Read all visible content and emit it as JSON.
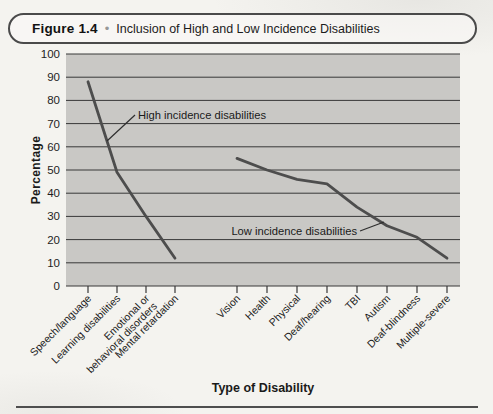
{
  "figure": {
    "label": "Figure 1.4",
    "bullet": "•",
    "title": "Inclusion of High and Low Incidence Disabilities"
  },
  "chart_data": {
    "type": "line",
    "title": "Figure 1.4 • Inclusion of High and Low Incidence Disabilities",
    "xlabel": "Type of Disability",
    "ylabel": "Percentage",
    "ylim": [
      0,
      100
    ],
    "ytick_step": 10,
    "grid": true,
    "legend": "inline-annotations",
    "plot_bg": "#c9c8c5",
    "grid_color": "#383838",
    "line_color": "#4d4d4d",
    "annotation_color": "#1a1a1a",
    "groups": [
      {
        "name": "High incidence disabilities",
        "categories": [
          "Speech/language",
          "Learning disabilities",
          "Emotional or\nbehavioral disorders",
          "Mental retardation"
        ],
        "values": [
          88,
          49,
          30,
          12
        ]
      },
      {
        "name": "Low incidence disabilities",
        "categories": [
          "Vision",
          "Health",
          "Physical",
          "Deaf/hearing",
          "TBI",
          "Autism",
          "Deaf-blindness",
          "Multiple-severe"
        ],
        "values": [
          55,
          50,
          46,
          44,
          34,
          26,
          21,
          12
        ]
      }
    ]
  }
}
